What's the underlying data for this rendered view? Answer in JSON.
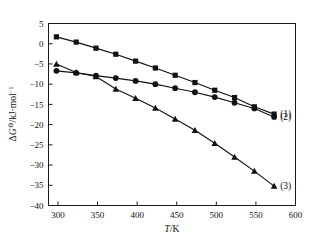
{
  "chart_data": {
    "type": "line",
    "title": "",
    "xlabel": "T/K",
    "ylabel": "ΔG⊖/kJ·mol⁻¹",
    "xlim": [
      288,
      600
    ],
    "ylim": [
      -40,
      5
    ],
    "xticks": [
      300,
      350,
      400,
      450,
      500,
      550,
      600
    ],
    "yticks": [
      5,
      0,
      -5,
      -10,
      -15,
      -20,
      -25,
      -30,
      -35,
      -40
    ],
    "xticklabels": [
      "300",
      "350",
      "400",
      "450",
      "500",
      "550",
      "600"
    ],
    "yticklabels": [
      "5",
      "0",
      "−5",
      "−10",
      "−15",
      "−20",
      "−25",
      "−30",
      "−35",
      "−40"
    ],
    "grid": false,
    "legend_position": "right-inline",
    "x": [
      298,
      323,
      348,
      373,
      398,
      423,
      448,
      473,
      498,
      523,
      548,
      573
    ],
    "series": [
      {
        "name": "(1)",
        "marker": "square",
        "label": "(1)",
        "values": [
          1.7,
          0.4,
          -1.1,
          -2.6,
          -4.3,
          -6.0,
          -7.8,
          -9.6,
          -11.5,
          -13.3,
          -15.6,
          -17.4
        ]
      },
      {
        "name": "(2)",
        "marker": "circle",
        "label": "(2)",
        "values": [
          -6.7,
          -7.2,
          -7.9,
          -8.5,
          -9.2,
          -10.0,
          -11.0,
          -12.0,
          -13.2,
          -14.6,
          -16.0,
          -18.1
        ]
      },
      {
        "name": "(3)",
        "marker": "triangle",
        "label": "(3)",
        "values": [
          -5.0,
          -7.1,
          -8.1,
          -11.2,
          -13.5,
          -15.9,
          -18.6,
          -21.4,
          -24.6,
          -28.0,
          -31.5,
          -35.2
        ]
      }
    ]
  },
  "axis": {
    "x_title": "T/K",
    "y_title_main": "ΔG",
    "y_title_super": "⊖",
    "y_title_rest": "/kJ·mol",
    "y_title_exp": "−1"
  },
  "labels": {
    "series1": "(1)",
    "series2": "(2)",
    "series3": "(3)"
  }
}
